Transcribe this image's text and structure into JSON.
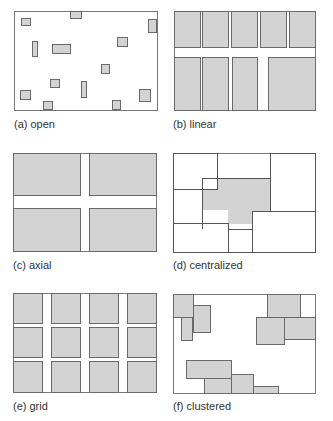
{
  "panels": [
    {
      "id": "a",
      "label": "(a) open"
    },
    {
      "id": "b",
      "label": "(b) linear"
    },
    {
      "id": "c",
      "label": "(c) axial"
    },
    {
      "id": "d",
      "label": "(d) centralized"
    },
    {
      "id": "e",
      "label": "(e) grid"
    },
    {
      "id": "f",
      "label": "(f) clustered"
    }
  ],
  "colors": {
    "room_fill": "#d3d3d3",
    "border": "#6a6a6a",
    "background": "#ffffff"
  }
}
